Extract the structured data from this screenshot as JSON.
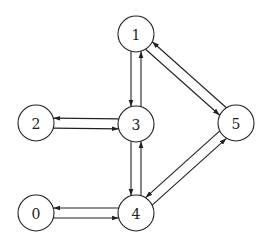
{
  "graph": {
    "type": "directed",
    "nodes": [
      {
        "id": "0",
        "label": "0"
      },
      {
        "id": "1",
        "label": "1"
      },
      {
        "id": "2",
        "label": "2"
      },
      {
        "id": "3",
        "label": "3"
      },
      {
        "id": "4",
        "label": "4"
      },
      {
        "id": "5",
        "label": "5"
      }
    ],
    "edges": [
      {
        "from": "1",
        "to": "3"
      },
      {
        "from": "3",
        "to": "1"
      },
      {
        "from": "1",
        "to": "5"
      },
      {
        "from": "5",
        "to": "1"
      },
      {
        "from": "3",
        "to": "2"
      },
      {
        "from": "2",
        "to": "3"
      },
      {
        "from": "3",
        "to": "4"
      },
      {
        "from": "4",
        "to": "3"
      },
      {
        "from": "4",
        "to": "5"
      },
      {
        "from": "5",
        "to": "4"
      },
      {
        "from": "4",
        "to": "0"
      },
      {
        "from": "0",
        "to": "4"
      }
    ]
  }
}
